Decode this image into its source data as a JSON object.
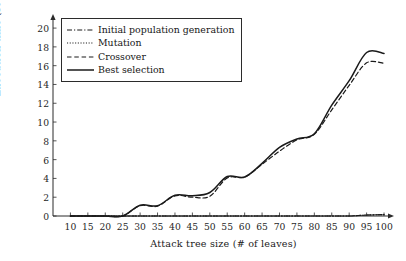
{
  "chart_data": {
    "type": "line",
    "title": "",
    "xlabel": "Attack tree size (# of leaves)",
    "ylabel": "Execution time (seconds)",
    "xlim": [
      5,
      102
    ],
    "ylim": [
      0,
      21.5
    ],
    "grid": false,
    "legend_position": "upper-left-inside",
    "xticks": [
      10,
      15,
      20,
      25,
      30,
      35,
      40,
      45,
      50,
      55,
      60,
      65,
      70,
      75,
      80,
      85,
      90,
      95,
      100
    ],
    "yticks": [
      0,
      2,
      4,
      6,
      8,
      10,
      12,
      14,
      16,
      18,
      20
    ],
    "x": [
      10,
      15,
      20,
      25,
      30,
      35,
      40,
      45,
      50,
      55,
      60,
      65,
      70,
      75,
      80,
      85,
      90,
      95,
      100
    ],
    "series": [
      {
        "name": "Initial population generation",
        "style": "dashdot",
        "color": "#1a1a1a",
        "values": [
          0,
          0,
          0,
          0,
          0,
          0,
          0,
          0,
          0,
          0,
          0,
          0,
          0,
          0,
          0,
          0,
          0,
          0.1,
          0.15
        ]
      },
      {
        "name": "Mutation",
        "style": "dotted",
        "color": "#1a1a1a",
        "values": [
          0,
          0,
          0,
          0,
          0,
          0,
          0,
          0,
          0,
          0,
          0,
          0,
          0,
          0,
          0,
          0,
          0,
          0.1,
          0.15
        ]
      },
      {
        "name": "Crossover",
        "style": "dashed",
        "color": "#1a1a1a",
        "values": [
          0,
          0,
          0,
          0,
          1.1,
          1.05,
          2.15,
          2.0,
          2.1,
          4.05,
          4.15,
          5.5,
          6.9,
          8.1,
          8.7,
          11.3,
          13.9,
          16.3,
          16.25
        ]
      },
      {
        "name": "Best selection",
        "style": "solid",
        "color": "#1a1a1a",
        "values": [
          0,
          0,
          0,
          0,
          1.15,
          1.1,
          2.2,
          2.15,
          2.5,
          4.2,
          4.15,
          5.6,
          7.3,
          8.2,
          8.75,
          11.8,
          14.4,
          17.4,
          17.3
        ]
      }
    ]
  },
  "legend": {
    "items": [
      {
        "label": "Initial population generation",
        "style": "dashdot"
      },
      {
        "label": "Mutation",
        "style": "dotted"
      },
      {
        "label": "Crossover",
        "style": "dashed"
      },
      {
        "label": "Best selection",
        "style": "solid"
      }
    ]
  },
  "axes": {
    "xlabel": "Attack tree size (# of leaves)",
    "ylabel": "Execution time (seconds)"
  }
}
